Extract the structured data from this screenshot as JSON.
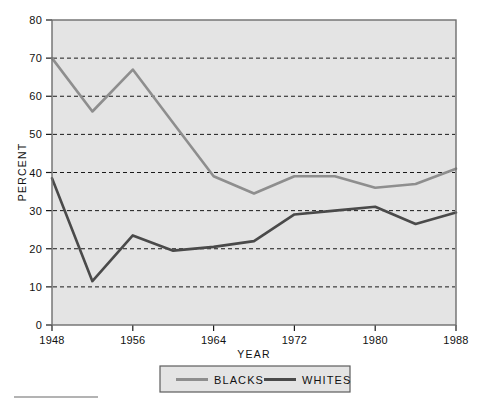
{
  "chart_data": {
    "type": "line",
    "title": "",
    "subtitle": "",
    "xlabel": "YEAR",
    "ylabel": "PERCENT",
    "xlim": [
      1948,
      1988
    ],
    "ylim": [
      0,
      80
    ],
    "grid": true,
    "grid_axis": "y",
    "legend_position": "bottom",
    "x": [
      1948,
      1952,
      1956,
      1960,
      1964,
      1968,
      1972,
      1976,
      1980,
      1984,
      1988
    ],
    "x_ticks": [
      1948,
      1956,
      1964,
      1972,
      1980,
      1988
    ],
    "x_tick_labels": [
      "1948",
      "1956",
      "1964",
      "1972",
      "1980",
      "1988"
    ],
    "y_ticks": [
      0,
      10,
      20,
      30,
      40,
      50,
      60,
      70,
      80
    ],
    "y_tick_labels": [
      "0",
      "10",
      "20",
      "30",
      "40",
      "50",
      "60",
      "70",
      "80"
    ],
    "series": [
      {
        "name": "BLACKS",
        "color": "#8e8e8e",
        "values": [
          70,
          56,
          67,
          53,
          39,
          34.5,
          39,
          39,
          36,
          37,
          41
        ]
      },
      {
        "name": "WHITES",
        "color": "#4a4a4a",
        "values": [
          38.5,
          11.5,
          23.5,
          19.5,
          20.5,
          22,
          29,
          30,
          31,
          26.5,
          29.5
        ]
      }
    ]
  },
  "axes": {
    "y_axis_title": "PERCENT",
    "x_axis_title": "YEAR"
  },
  "legend": {
    "items": [
      {
        "label": "BLACKS",
        "color": "#8e8e8e"
      },
      {
        "label": "WHITES",
        "color": "#4a4a4a"
      }
    ]
  },
  "colors": {
    "plot_background": "#e4e4e4",
    "page_background": "#ffffff",
    "frame": "#6e6e6e",
    "grid": "#1a1a1a",
    "blacks_series": "#8e8e8e",
    "whites_series": "#4a4a4a"
  }
}
